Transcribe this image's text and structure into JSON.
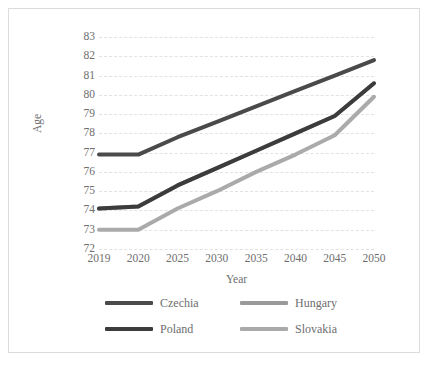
{
  "chart_data": {
    "type": "line",
    "title": "",
    "xlabel": "Year",
    "ylabel": "Age",
    "categories": [
      "2019",
      "2020",
      "2025",
      "2030",
      "2035",
      "2040",
      "2045",
      "2050"
    ],
    "ylim": [
      72,
      83
    ],
    "yticks": [
      72,
      73,
      74,
      75,
      76,
      77,
      78,
      79,
      80,
      81,
      82,
      83
    ],
    "grid": true,
    "legend_position": "bottom",
    "series": [
      {
        "name": "Czechia",
        "color": "#4a4a4a",
        "values": [
          76.9,
          76.9,
          77.8,
          78.6,
          79.4,
          80.2,
          81.0,
          81.8
        ]
      },
      {
        "name": "Hungary",
        "color": "#9a9a9a",
        "values": [
          74.1,
          74.2,
          75.3,
          76.2,
          77.1,
          78.0,
          78.9,
          80.6
        ]
      },
      {
        "name": "Poland",
        "color": "#3c3c3c",
        "values": [
          74.1,
          74.2,
          75.3,
          76.2,
          77.1,
          78.0,
          78.9,
          80.6
        ]
      },
      {
        "name": "Slovakia",
        "color": "#aaaaaa",
        "values": [
          73.0,
          73.0,
          74.1,
          75.0,
          76.0,
          76.9,
          77.9,
          79.9
        ]
      }
    ]
  },
  "legend": {
    "items": [
      {
        "label": "Czechia",
        "color": "#4a4a4a"
      },
      {
        "label": "Hungary",
        "color": "#9a9a9a"
      },
      {
        "label": "Poland",
        "color": "#3c3c3c"
      },
      {
        "label": "Slovakia",
        "color": "#aaaaaa"
      }
    ]
  },
  "colors": {
    "grid": "#e2e2e2",
    "text": "#6e6e6e",
    "border": "#dcdcdc",
    "background": "#ffffff"
  }
}
